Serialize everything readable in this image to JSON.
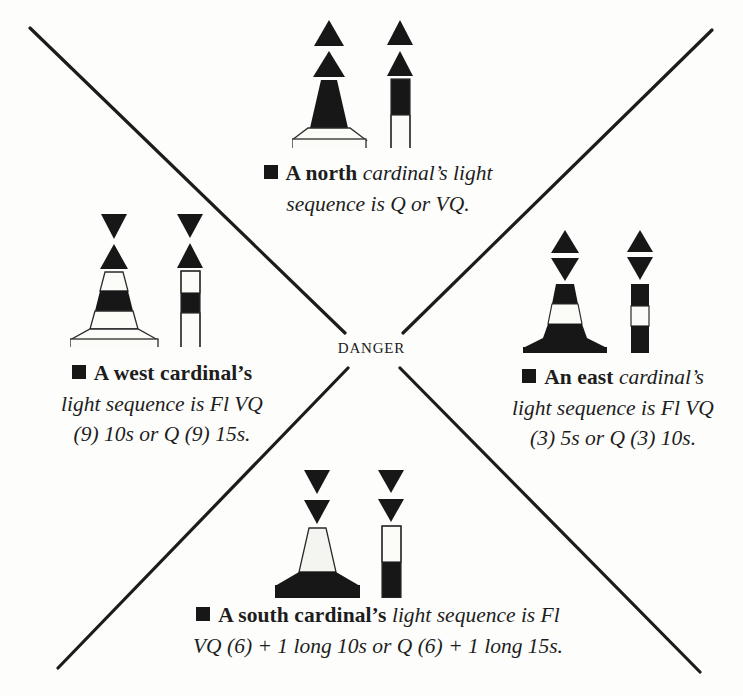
{
  "diagram": {
    "center_label": "DANGER",
    "accent_black": "#171717",
    "background": "#fdfdfc"
  },
  "marks": {
    "north": {
      "name": "north-cardinal-mark",
      "topmark": "two cones point up",
      "colours": "black above yellow",
      "caption_line1_prefix": "A north",
      "caption_line1_rest": " cardinal’s light",
      "caption_line2": "sequence is Q or VQ."
    },
    "west": {
      "name": "west-cardinal-mark",
      "topmark": "two cones point to point",
      "colours": "yellow with black band",
      "caption_line1_prefix": "A west cardinal’s",
      "caption_line2": "light sequence is Fl VQ",
      "caption_line3": "(9) 10s or Q (9) 15s."
    },
    "east": {
      "name": "east-cardinal-mark",
      "topmark": "two cones base to base",
      "colours": "black with yellow band",
      "caption_line1_prefix": "An east",
      "caption_line1_rest": " cardinal’s",
      "caption_line2": "light sequence is Fl VQ",
      "caption_line3": "(3) 5s or Q (3) 10s."
    },
    "south": {
      "name": "south-cardinal-mark",
      "topmark": "two cones point down",
      "colours": "yellow above black",
      "caption_line1_prefix": "A south cardinal’s",
      "caption_line1_rest": " light sequence is Fl",
      "caption_line2": "VQ (6) + 1 long 10s or Q (6) + 1 long 15s."
    }
  }
}
